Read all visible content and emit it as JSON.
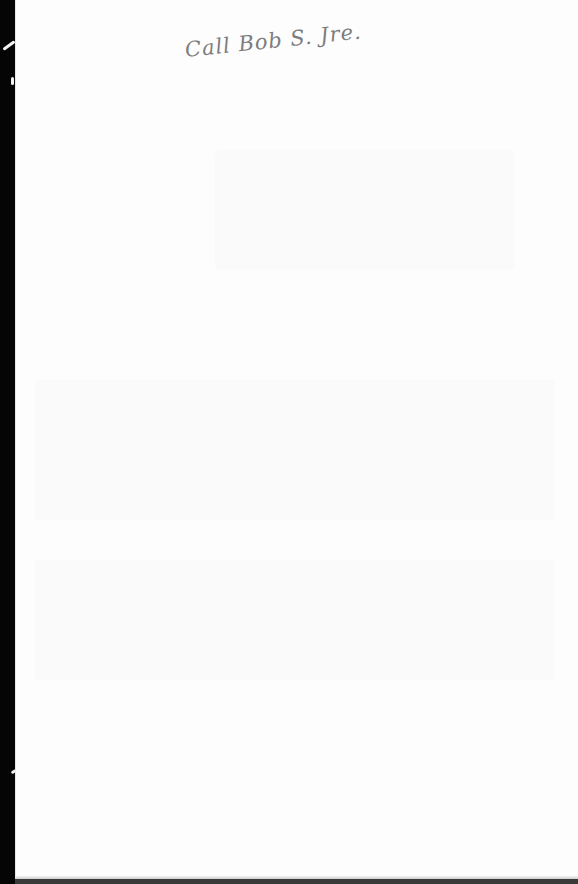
{
  "document": {
    "type": "scanned-page",
    "handwritten_note": "Call Bob S. Jre.",
    "body_text": ""
  }
}
